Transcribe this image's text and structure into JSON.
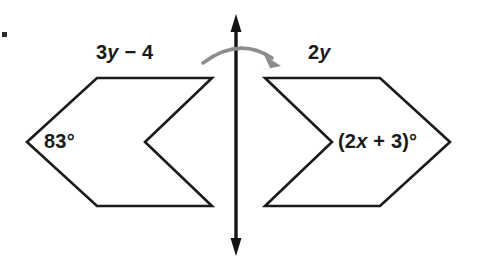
{
  "figure": {
    "labels": {
      "top_left_side": "3y − 4",
      "top_left_coefficient": "3",
      "top_left_variable": "y",
      "top_left_operator": " − 4",
      "top_right_side": "2y",
      "top_right_coefficient": "2",
      "top_right_variable": "y",
      "left_angle": "83°",
      "right_angle_prefix": "(2",
      "right_angle_variable": "x",
      "right_angle_suffix": " + 3)°",
      "right_angle_full": "(2x + 3)°"
    },
    "colors": {
      "outline": "#1a1a1a",
      "mirror_line": "#141414",
      "reflection_arrow": "#8d8d8d",
      "background": "#ffffff",
      "text": "#1a1a1a"
    },
    "mirror_line": {
      "x": 236,
      "y_top": 18,
      "y_bottom": 252,
      "arrowheads": "both"
    },
    "reflection_arrow": {
      "direction": "left-to-right",
      "arc_start_x": 203,
      "arc_end_x": 277,
      "arc_peak_y": 50
    },
    "shapes": [
      {
        "name": "left-chevron",
        "points": "27,142 97,78 212,78 145,142 212,206 97,206",
        "angle_label": "83°",
        "side_label": "3y − 4"
      },
      {
        "name": "right-chevron",
        "points": "450,142 380,78 265,78 332,142 265,206 380,206",
        "angle_label": "(2x + 3)°",
        "side_label": "2y"
      }
    ]
  }
}
